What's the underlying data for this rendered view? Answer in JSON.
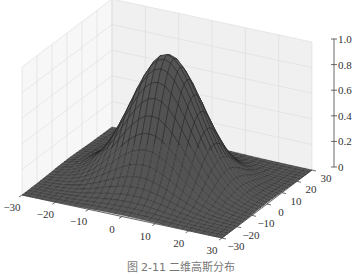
{
  "chart_data": {
    "type": "surface3d",
    "title": "",
    "caption": "图 2-11   二维高斯分布",
    "function": "z = exp(-(x^2 + y^2) / (2 * sigma^2))",
    "sigma": 10,
    "x": {
      "label": "",
      "range": [
        -30,
        30
      ],
      "ticks": [
        -30,
        -20,
        -10,
        0,
        10,
        20,
        30
      ]
    },
    "y": {
      "label": "",
      "range": [
        -30,
        30
      ],
      "ticks": [
        -30,
        -20,
        -10,
        0,
        10,
        20,
        30
      ]
    },
    "z": {
      "label": "",
      "range": [
        0,
        1.0
      ],
      "ticks": [
        0,
        0.2,
        0.4,
        0.6,
        0.8,
        1.0
      ]
    },
    "grid": true,
    "peak": {
      "x": 0,
      "y": 0,
      "z": 1.0
    },
    "mesh_resolution": 30,
    "colors": {
      "surface": "#5a5a5a",
      "surface_light": "#6e6e6e",
      "mesh_line": "#1e1e1e",
      "pane": "#f3f3f3",
      "pane_grid": "#dcdcdc",
      "axis": "#444444"
    }
  }
}
